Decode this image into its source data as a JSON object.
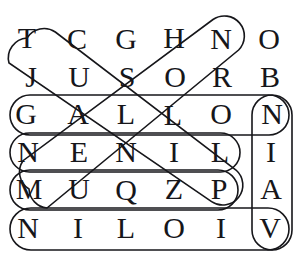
{
  "puzzle": {
    "type": "word-search",
    "rows": 6,
    "columns": 7,
    "grid": [
      [
        "T",
        "C",
        "G",
        "H",
        "N",
        "O",
        "O"
      ],
      [
        "J",
        "U",
        "S",
        "O",
        "R",
        "B",
        "B"
      ],
      [
        "G",
        "A",
        "L",
        "L",
        "O",
        "N",
        "N"
      ],
      [
        "N",
        "E",
        "N",
        "I",
        "L",
        "",
        "I"
      ],
      [
        "M",
        "U",
        "Q",
        "Z",
        "P",
        "",
        "A"
      ],
      [
        "N",
        "I",
        "L",
        "O",
        "I",
        "V",
        "V"
      ]
    ],
    "visible_letters": [
      {
        "row": 0,
        "col": 0,
        "char": "T",
        "x": 27,
        "y": 38
      },
      {
        "row": 0,
        "col": 1,
        "char": "C",
        "x": 77,
        "y": 39
      },
      {
        "row": 0,
        "col": 2,
        "char": "G",
        "x": 126,
        "y": 39
      },
      {
        "row": 0,
        "col": 3,
        "char": "H",
        "x": 174,
        "y": 38
      },
      {
        "row": 0,
        "col": 4,
        "char": "N",
        "x": 221,
        "y": 39
      },
      {
        "row": 0,
        "col": 5,
        "char": "O",
        "x": 269,
        "y": 39
      },
      {
        "row": 1,
        "col": 0,
        "char": "J",
        "x": 31,
        "y": 77
      },
      {
        "row": 1,
        "col": 1,
        "char": "U",
        "x": 79,
        "y": 77
      },
      {
        "row": 1,
        "col": 2,
        "char": "S",
        "x": 127,
        "y": 77
      },
      {
        "row": 1,
        "col": 3,
        "char": "O",
        "x": 175,
        "y": 77
      },
      {
        "row": 1,
        "col": 4,
        "char": "R",
        "x": 222,
        "y": 77
      },
      {
        "row": 1,
        "col": 5,
        "char": "B",
        "x": 270,
        "y": 77
      },
      {
        "row": 2,
        "col": 0,
        "char": "G",
        "x": 26,
        "y": 114
      },
      {
        "row": 2,
        "col": 1,
        "char": "A",
        "x": 78,
        "y": 114
      },
      {
        "row": 2,
        "col": 2,
        "char": "L",
        "x": 126,
        "y": 114
      },
      {
        "row": 2,
        "col": 3,
        "char": "L",
        "x": 173,
        "y": 115
      },
      {
        "row": 2,
        "col": 4,
        "char": "O",
        "x": 221,
        "y": 114
      },
      {
        "row": 2,
        "col": 5,
        "char": "N",
        "x": 272,
        "y": 114
      },
      {
        "row": 3,
        "col": 0,
        "char": "N",
        "x": 28,
        "y": 152
      },
      {
        "row": 3,
        "col": 1,
        "char": "E",
        "x": 79,
        "y": 152
      },
      {
        "row": 3,
        "col": 2,
        "char": "N",
        "x": 126,
        "y": 152
      },
      {
        "row": 3,
        "col": 3,
        "char": "I",
        "x": 174,
        "y": 152
      },
      {
        "row": 3,
        "col": 4,
        "char": "L",
        "x": 220,
        "y": 152
      },
      {
        "row": 3,
        "col": 5,
        "char": "I",
        "x": 271,
        "y": 152
      },
      {
        "row": 4,
        "col": 0,
        "char": "M",
        "x": 29,
        "y": 189
      },
      {
        "row": 4,
        "col": 1,
        "char": "U",
        "x": 79,
        "y": 189
      },
      {
        "row": 4,
        "col": 2,
        "char": "Q",
        "x": 126,
        "y": 190
      },
      {
        "row": 4,
        "col": 3,
        "char": "Z",
        "x": 174,
        "y": 189
      },
      {
        "row": 4,
        "col": 4,
        "char": "P",
        "x": 219,
        "y": 189
      },
      {
        "row": 4,
        "col": 5,
        "char": "A",
        "x": 271,
        "y": 189
      },
      {
        "row": 5,
        "col": 0,
        "char": "N",
        "x": 28,
        "y": 228
      },
      {
        "row": 5,
        "col": 1,
        "char": "I",
        "x": 78,
        "y": 228
      },
      {
        "row": 5,
        "col": 2,
        "char": "L",
        "x": 126,
        "y": 228
      },
      {
        "row": 5,
        "col": 3,
        "char": "O",
        "x": 174,
        "y": 228
      },
      {
        "row": 5,
        "col": 4,
        "char": "I",
        "x": 221,
        "y": 228
      },
      {
        "row": 5,
        "col": 5,
        "char": "V",
        "x": 270,
        "y": 228
      }
    ],
    "highlights": [
      {
        "name": "gallon-row-highlight",
        "orientation": "horizontal",
        "letters": "GALLONN",
        "shape": "rounded-rect",
        "x": 10,
        "y": 95,
        "width": 279,
        "height": 40
      },
      {
        "name": "nenil-row-highlight",
        "orientation": "horizontal",
        "letters": "NENIL",
        "shape": "rounded-rect",
        "x": 10,
        "y": 133,
        "width": 230,
        "height": 39
      },
      {
        "name": "muqzp-row-highlight",
        "orientation": "horizontal",
        "letters": "MUQZP",
        "shape": "rounded-rect",
        "x": 10,
        "y": 170,
        "width": 228,
        "height": 40
      },
      {
        "name": "niloiv-row-highlight",
        "orientation": "horizontal",
        "letters": "NILOIV",
        "shape": "rounded-rect",
        "x": 10,
        "y": 208,
        "width": 279,
        "height": 42
      },
      {
        "name": "niav-column-highlight",
        "orientation": "vertical",
        "letters": "NIAV",
        "shape": "rounded-rect",
        "x": 252,
        "y": 95,
        "width": 40,
        "height": 155
      },
      {
        "name": "diagonal-down-right-highlight",
        "orientation": "diagonal-down-right",
        "letters": "TSLZP",
        "shape": "rounded-capsule",
        "from": {
          "x": 27,
          "y": 38
        },
        "to": {
          "x": 219,
          "y": 189
        }
      },
      {
        "name": "diagonal-up-right-highlight",
        "orientation": "diagonal-up-right",
        "letters": "MLLSN",
        "shape": "rounded-capsule",
        "from": {
          "x": 29,
          "y": 189
        },
        "to": {
          "x": 221,
          "y": 39
        }
      }
    ],
    "colors": {
      "ink": "#16161a",
      "background": "#ffffff"
    }
  }
}
